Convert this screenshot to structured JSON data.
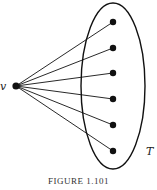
{
  "figure": {
    "caption": "FIGURE 1.101",
    "vertex_label": "v",
    "set_label": "T",
    "stroke_color": "#111111",
    "vertex": {
      "x": 16,
      "y": 86
    },
    "set_ellipse": {
      "cx": 113,
      "cy": 86,
      "rx": 32,
      "ry": 83
    },
    "set_nodes": [
      {
        "x": 113,
        "y": 22
      },
      {
        "x": 113,
        "y": 48
      },
      {
        "x": 113,
        "y": 73
      },
      {
        "x": 113,
        "y": 99
      },
      {
        "x": 113,
        "y": 125
      },
      {
        "x": 113,
        "y": 151
      }
    ]
  }
}
